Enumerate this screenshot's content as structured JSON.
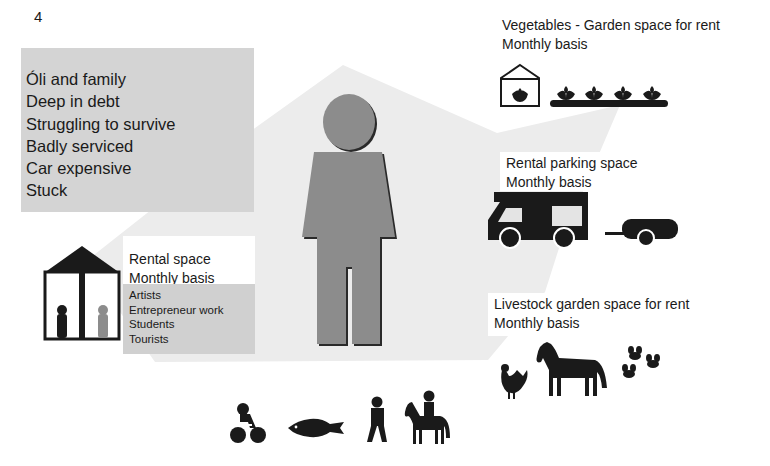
{
  "page_number": "4",
  "central_figure": {
    "icon": "person-icon",
    "color": "#8c8c8c"
  },
  "status_box": {
    "lines": [
      "Óli and family",
      "Deep in debt",
      "Struggling to survive",
      "Badly serviced",
      "Car expensive",
      "Stuck"
    ],
    "background": "#d4d4d4"
  },
  "rental_space": {
    "icon": "house-with-people-icon",
    "title": "Rental space",
    "subtitle": "Monthly basis",
    "audiences": [
      "Artists",
      "Entrepreneur work",
      "Students",
      "Tourists"
    ]
  },
  "vegetables": {
    "icon": "greenhouse-plants-icon",
    "title": "Vegetables - Garden space for rent",
    "subtitle": "Monthly basis"
  },
  "parking": {
    "icon": "camper-van-trailer-icon",
    "title": "Rental parking space",
    "subtitle": "Monthly basis"
  },
  "livestock": {
    "icon": "chicken-horse-bees-icon",
    "title": "Livestock garden space for rent",
    "subtitle": "Monthly basis"
  },
  "activities": {
    "icons": [
      "cyclist-icon",
      "fish-icon",
      "walker-icon",
      "horse-rider-icon"
    ]
  },
  "colors": {
    "background_polygon": "#ececec",
    "ink": "#1a1a1a",
    "figure_gray": "#8c8c8c"
  }
}
